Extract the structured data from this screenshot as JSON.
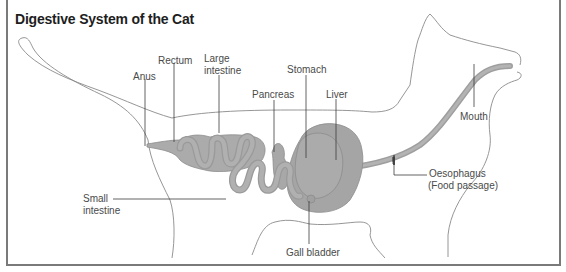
{
  "title": "Digestive System of the Cat",
  "colors": {
    "organ_fill": "#a9a9a9",
    "organ_stroke": "#8c8c8c",
    "outline": "#7a7a7a",
    "leader": "#3c3c3c",
    "text": "#4a4a4a"
  },
  "labels": {
    "anus": "Anus",
    "rectum": "Rectum",
    "large_intestine_1": "Large",
    "large_intestine_2": "intestine",
    "pancreas": "Pancreas",
    "stomach": "Stomach",
    "liver": "Liver",
    "mouth": "Mouth",
    "oesophagus_1": "Oesophagus",
    "oesophagus_2": "(Food passage)",
    "small_intestine_1": "Small",
    "small_intestine_2": "intestine",
    "gall_bladder": "Gall bladder"
  }
}
